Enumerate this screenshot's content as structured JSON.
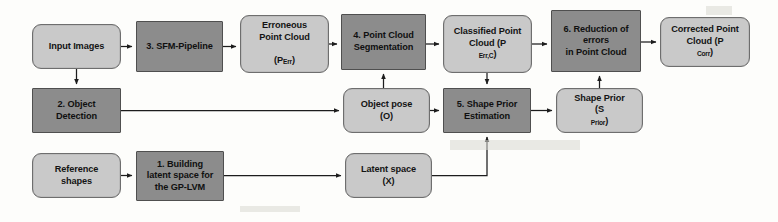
{
  "diagram": {
    "colors": {
      "process_fill": "#8c8c8c",
      "data_fill": "#c9c9c9",
      "stroke": "#4f4f4f",
      "background": "#fdfdfb",
      "text": "#141414"
    },
    "nodes": [
      {
        "id": "input-images",
        "label": "Input Images",
        "shape": "rounded",
        "kind": "data",
        "x": 32,
        "y": 24,
        "w": 89,
        "h": 45
      },
      {
        "id": "sfm-pipeline",
        "label": "3. SFM-Pipeline",
        "shape": "rect",
        "kind": "process",
        "x": 136,
        "y": 21,
        "w": 87,
        "h": 51
      },
      {
        "id": "erroneous-point-cloud",
        "label": "Erroneous\nPoint Cloud",
        "sublabel": "(P",
        "subscript": "Err",
        "sublabel_end": ")",
        "shape": "rounded",
        "kind": "data",
        "x": 240,
        "y": 15,
        "w": 89,
        "h": 58
      },
      {
        "id": "point-cloud-segmentation",
        "label": "4. Point Cloud\nSegmentation",
        "shape": "rect",
        "kind": "process",
        "x": 341,
        "y": 14,
        "w": 85,
        "h": 56
      },
      {
        "id": "classified-point-cloud",
        "label": "Classified Point\nCloud (P",
        "subscript": "Err,C",
        "sublabel_end": ")",
        "shape": "rounded",
        "kind": "data",
        "x": 443,
        "y": 15,
        "w": 89,
        "h": 58
      },
      {
        "id": "reduction-of-errors",
        "label": "6. Reduction of\nerrors\nin Point Cloud",
        "shape": "rect",
        "kind": "process",
        "x": 551,
        "y": 10,
        "w": 90,
        "h": 62
      },
      {
        "id": "corrected-point-cloud",
        "label": "Corrected Point\nCloud (P",
        "subscript": "Corr",
        "sublabel_end": ")",
        "shape": "rounded",
        "kind": "data",
        "x": 660,
        "y": 17,
        "w": 90,
        "h": 50
      },
      {
        "id": "object-detection",
        "label": "2. Object\nDetection",
        "shape": "rect",
        "kind": "process",
        "x": 32,
        "y": 88,
        "w": 89,
        "h": 45
      },
      {
        "id": "object-pose",
        "label": "Object pose\n(O)",
        "shape": "rounded",
        "kind": "data",
        "x": 343,
        "y": 88,
        "w": 87,
        "h": 45
      },
      {
        "id": "shape-prior-estimation",
        "label": "5. Shape Prior\nEstimation",
        "shape": "rect",
        "kind": "process",
        "x": 443,
        "y": 88,
        "w": 88,
        "h": 45
      },
      {
        "id": "shape-prior",
        "label": "Shape Prior\n(S",
        "subscript": "Prior",
        "sublabel_end": ")",
        "shape": "rounded",
        "kind": "data",
        "x": 556,
        "y": 88,
        "w": 87,
        "h": 45
      },
      {
        "id": "reference-shapes",
        "label": "Reference\nshapes",
        "shape": "rounded",
        "kind": "data",
        "x": 32,
        "y": 153,
        "w": 89,
        "h": 45
      },
      {
        "id": "building-latent-space",
        "label": "1. Building\nlatent space for\nthe GP-LVM",
        "shape": "rect",
        "kind": "process",
        "x": 136,
        "y": 151,
        "w": 88,
        "h": 50
      },
      {
        "id": "latent-space",
        "label": "Latent space\n(X)",
        "shape": "rounded",
        "kind": "data",
        "x": 345,
        "y": 153,
        "w": 87,
        "h": 45
      }
    ],
    "edges": [
      {
        "id": "edge-input-to-sfm",
        "from": "input-images",
        "to": "sfm-pipeline"
      },
      {
        "id": "edge-sfm-to-erroneous",
        "from": "sfm-pipeline",
        "to": "erroneous-point-cloud"
      },
      {
        "id": "edge-erroneous-to-segmentation",
        "from": "erroneous-point-cloud",
        "to": "point-cloud-segmentation"
      },
      {
        "id": "edge-segmentation-to-classified",
        "from": "point-cloud-segmentation",
        "to": "classified-point-cloud"
      },
      {
        "id": "edge-classified-to-reduction",
        "from": "classified-point-cloud",
        "to": "reduction-of-errors"
      },
      {
        "id": "edge-reduction-to-corrected",
        "from": "reduction-of-errors",
        "to": "corrected-point-cloud"
      },
      {
        "id": "edge-input-to-object-detection",
        "from": "input-images",
        "to": "object-detection"
      },
      {
        "id": "edge-object-detection-to-object-pose",
        "from": "object-detection",
        "to": "object-pose"
      },
      {
        "id": "edge-object-pose-to-estimation",
        "from": "object-pose",
        "to": "shape-prior-estimation"
      },
      {
        "id": "edge-estimation-to-shape-prior",
        "from": "shape-prior-estimation",
        "to": "shape-prior"
      },
      {
        "id": "edge-classified-to-estimation",
        "from": "classified-point-cloud",
        "to": "shape-prior-estimation"
      },
      {
        "id": "edge-shape-prior-to-reduction",
        "from": "shape-prior",
        "to": "reduction-of-errors"
      },
      {
        "id": "edge-object-pose-to-segmentation",
        "from": "object-pose",
        "to": "point-cloud-segmentation"
      },
      {
        "id": "edge-reference-to-building",
        "from": "reference-shapes",
        "to": "building-latent-space"
      },
      {
        "id": "edge-building-to-latent",
        "from": "building-latent-space",
        "to": "latent-space"
      },
      {
        "id": "edge-latent-to-estimation",
        "from": "latent-space",
        "to": "shape-prior-estimation"
      }
    ]
  }
}
